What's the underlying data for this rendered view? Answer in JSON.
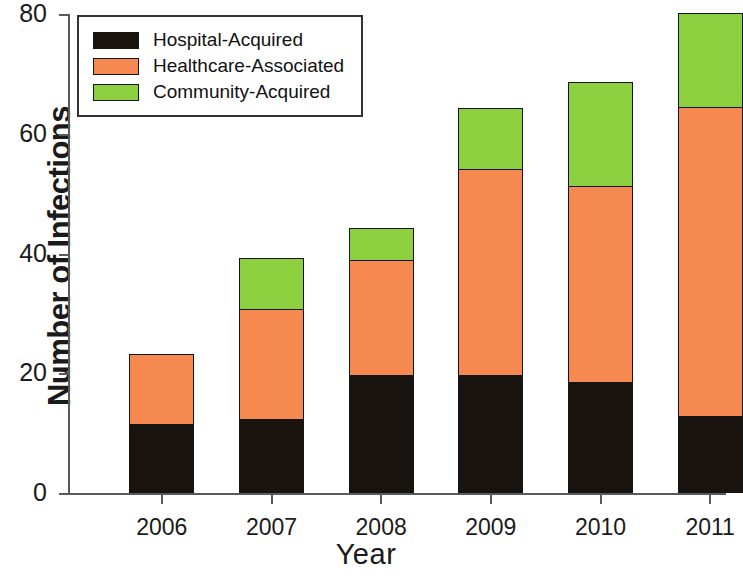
{
  "chart_data": {
    "type": "bar",
    "subtype": "stacked-bar",
    "title": "",
    "xlabel": "Year",
    "ylabel": "Number of Infections",
    "categories": [
      "2006",
      "2007",
      "2008",
      "2009",
      "2010",
      "2011"
    ],
    "ylim": [
      0,
      80
    ],
    "yticks": [
      0,
      20,
      40,
      60,
      80
    ],
    "ytick_labels": [
      "0",
      "20",
      "40",
      "60",
      "80"
    ],
    "grid": false,
    "legend_position": "upper left",
    "series": [
      {
        "name": "Hospital-Acquired",
        "color": "#1a1410",
        "values": [
          11.3,
          12.2,
          19.5,
          19.5,
          18.4,
          12.7
        ]
      },
      {
        "name": "Healthcare-Associated",
        "color": "#f5894f",
        "values": [
          11.7,
          18.3,
          19.2,
          34.5,
          32.7,
          51.6
        ]
      },
      {
        "name": "Community-Acquired",
        "color": "#8ccf3f",
        "values": [
          0,
          8.5,
          5.3,
          10.0,
          17.3,
          15.7
        ]
      }
    ],
    "totals": [
      23,
      39,
      44,
      64,
      68.4,
      80
    ]
  },
  "axes": {
    "y_title": "Number of Infections",
    "x_title": "Year"
  },
  "legend": {
    "items": [
      {
        "label": "Hospital-Acquired",
        "color": "#1a1410"
      },
      {
        "label": "Healthcare-Associated",
        "color": "#f5894f"
      },
      {
        "label": "Community-Acquired",
        "color": "#8ccf3f"
      }
    ]
  }
}
